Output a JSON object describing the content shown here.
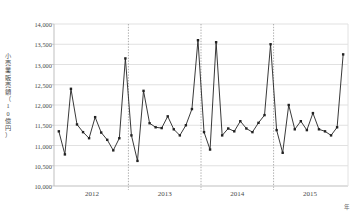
{
  "chart_data": {
    "type": "line",
    "title": "",
    "subtitle": "",
    "xlabel": "年",
    "ylabel": "小売業販売額（10億円）",
    "ylim": [
      10000,
      14000
    ],
    "ytick_step": 500,
    "ytick_labels": [
      "14,000",
      "13,500",
      "13,000",
      "12,500",
      "12,000",
      "11,500",
      "11,000",
      "10,500",
      "10,000"
    ],
    "ytick_values": [
      14000,
      13500,
      13000,
      12500,
      12000,
      11500,
      11000,
      10500,
      10000
    ],
    "xtick_labels": [
      "2012",
      "2013",
      "2014",
      "2015"
    ],
    "xtick_values": [
      2012,
      2013,
      2014,
      2015
    ],
    "grid": "horizontal-solid-and-vertical-dotted",
    "legend": "none",
    "marker": "filled-square",
    "line_color": "#222222",
    "grid_color": "#d9d9d9",
    "axis_color": "#bfbfbf",
    "x": [
      "2012-01",
      "2012-02",
      "2012-03",
      "2012-04",
      "2012-05",
      "2012-06",
      "2012-07",
      "2012-08",
      "2012-09",
      "2012-10",
      "2012-11",
      "2012-12",
      "2013-01",
      "2013-02",
      "2013-03",
      "2013-04",
      "2013-05",
      "2013-06",
      "2013-07",
      "2013-08",
      "2013-09",
      "2013-10",
      "2013-11",
      "2013-12",
      "2014-01",
      "2014-02",
      "2014-03",
      "2014-04",
      "2014-05",
      "2014-06",
      "2014-07",
      "2014-08",
      "2014-09",
      "2014-10",
      "2014-11",
      "2014-12",
      "2015-01",
      "2015-02",
      "2015-03",
      "2015-04",
      "2015-05",
      "2015-06",
      "2015-07",
      "2015-08",
      "2015-09",
      "2015-10",
      "2015-11",
      "2015-12"
    ],
    "values": [
      11350,
      10780,
      12400,
      11520,
      11330,
      11180,
      11700,
      11320,
      11140,
      10880,
      11180,
      13150,
      11250,
      10620,
      12350,
      11550,
      11450,
      11430,
      11720,
      11400,
      11250,
      11500,
      11900,
      13600,
      11330,
      10900,
      13550,
      11250,
      11420,
      11350,
      11600,
      11420,
      11330,
      11560,
      11750,
      13500,
      11380,
      10820,
      12000,
      11400,
      11600,
      11380,
      11800,
      11400,
      11350,
      11250,
      11450,
      13250
    ],
    "series": [
      {
        "name": "小売業販売額",
        "values": [
          11350,
          10780,
          12400,
          11520,
          11330,
          11180,
          11700,
          11320,
          11140,
          10880,
          11180,
          13150,
          11250,
          10620,
          12350,
          11550,
          11450,
          11430,
          11720,
          11400,
          11250,
          11500,
          11900,
          13600,
          11330,
          10900,
          13550,
          11250,
          11420,
          11350,
          11600,
          11420,
          11330,
          11560,
          11750,
          13500,
          11380,
          10820,
          12000,
          11400,
          11600,
          11380,
          11800,
          11400,
          11350,
          11250,
          11450,
          13250
        ]
      }
    ]
  },
  "axis": {
    "y_label_chars": [
      "小",
      "売",
      "業",
      "販",
      "売",
      "額",
      "（",
      "1",
      "0",
      "億",
      "円",
      "）"
    ],
    "x_unit": "年"
  }
}
